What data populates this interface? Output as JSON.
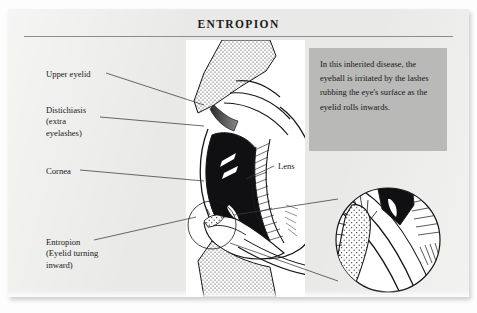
{
  "page": {
    "title": "ENTROPION"
  },
  "note": {
    "text": "In this inherited disease, the eyeball is irritated by the lashes rubbing the eye's surface as the eyelid rolls inwards."
  },
  "labels": {
    "upper_eyelid": "Upper eyelid",
    "distichiasis": "Distichiasis\n(extra\neyelashes)",
    "cornea": "Cornea",
    "lens": "Lens",
    "entropion": "Entropion\n(Eyelid turning\ninward)"
  },
  "illustration": {
    "type": "anatomical-cross-section",
    "subject": "eye",
    "features": [
      "upper-eyelid",
      "lower-eyelid-turning-inward",
      "cornea",
      "lens",
      "eyelashes",
      "magnified-inset-circle"
    ]
  },
  "colors": {
    "paper": "#e9e9e7",
    "plate": "#ffffff",
    "note_box": "#b9b9b7",
    "ink": "#17171a",
    "rule": "#8d8d8d"
  }
}
